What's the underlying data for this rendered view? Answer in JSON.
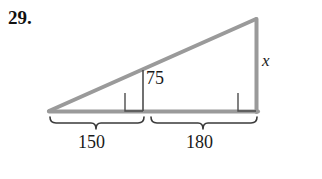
{
  "figure": {
    "problem_number": "29.",
    "type": "geometry-diagram",
    "shape": "right-triangle-with-altitude",
    "labels": {
      "altitude": "75",
      "hypotenuse_leg_unknown": "x",
      "segment_left": "150",
      "segment_right": "180"
    },
    "colors": {
      "triangle_stroke": "#9a9a9a",
      "altitude_stroke": "#4d4d4d",
      "right_angle_stroke": "#4d4d4d",
      "brace_stroke": "#3a3a3a",
      "text": "#1a1a1a",
      "background": "#ffffff"
    },
    "geometry": {
      "apex": [
        256,
        19
      ],
      "left_vertex": [
        49,
        111
      ],
      "right_vertex": [
        257,
        111
      ],
      "altitude_foot": [
        143,
        111
      ],
      "altitude_top": [
        143,
        70
      ]
    },
    "braces": {
      "left": {
        "start_x": 49,
        "end_x": 144,
        "label": "150"
      },
      "right": {
        "start_x": 150,
        "end_x": 257,
        "label": "180"
      }
    },
    "right_angle_markers": [
      {
        "name": "altitude-foot-right-angle",
        "x": 125,
        "y": 93,
        "size": 18
      },
      {
        "name": "triangle-right-angle",
        "x": 238,
        "y": 93,
        "size": 18
      }
    ]
  }
}
